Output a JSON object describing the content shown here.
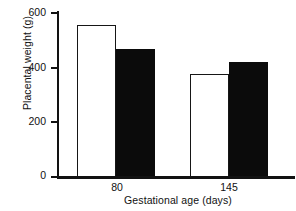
{
  "chart_data": {
    "type": "bar",
    "title": "",
    "xlabel": "Gestational age (days)",
    "ylabel": "Placental weight (g)",
    "categories": [
      "80",
      "145"
    ],
    "series": [
      {
        "name": "open",
        "values": [
          553,
          375
        ]
      },
      {
        "name": "filled",
        "values": [
          466,
          417
        ]
      }
    ],
    "ylim": [
      0,
      600
    ],
    "yticks": [
      "0",
      "200",
      "400",
      "600"
    ],
    "ytick_values": [
      0,
      200,
      400,
      600
    ],
    "grid": false,
    "legend": "none",
    "colors": {
      "open_bar_fill": "#ffffff",
      "open_bar_edge": "#161616",
      "filled_bar": "#0b0b0b",
      "axis": "#121212",
      "text": "#111111",
      "background": "#ffffff"
    }
  },
  "axis": {
    "y": {
      "label": "Placental weight (g)",
      "ticks": [
        {
          "text": "600"
        },
        {
          "text": "400"
        },
        {
          "text": "200"
        },
        {
          "text": "0"
        }
      ]
    },
    "x": {
      "label": "Gestational age (days)",
      "ticks": [
        {
          "text": "80"
        },
        {
          "text": "145"
        }
      ]
    }
  }
}
